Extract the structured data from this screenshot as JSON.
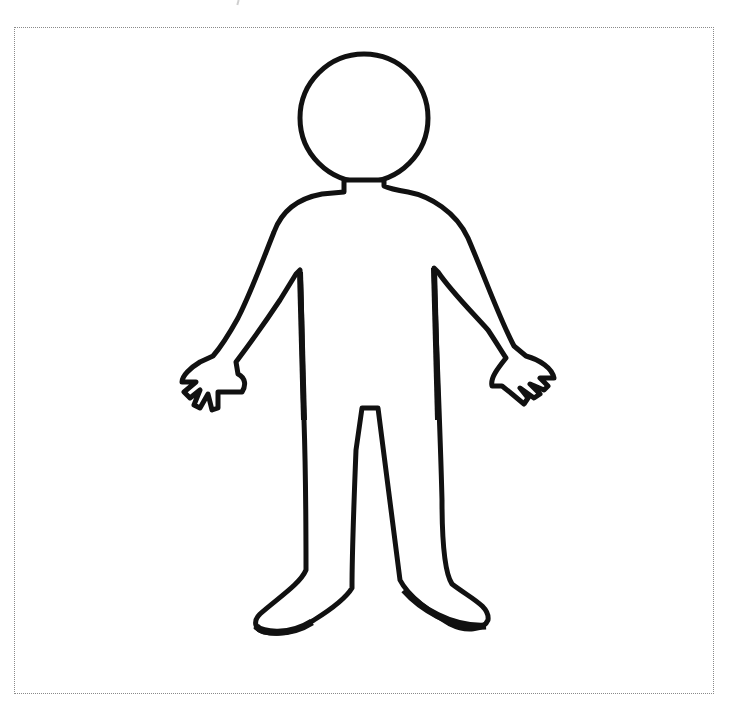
{
  "image": {
    "subject": "blank human body outline (gingerbread-style figure)",
    "stroke_color": "#111111",
    "fill_color": "#ffffff",
    "frame_border_color": "#8a8a8a",
    "frame_style": "dotted"
  }
}
